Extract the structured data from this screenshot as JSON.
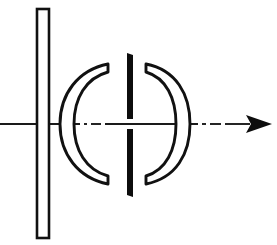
{
  "figure": {
    "kind": "optical-system-schematic",
    "background_color": "#ffffff",
    "ink_color": "#111111",
    "width": 277,
    "height": 245
  },
  "optical_axis": {
    "name": "optical-axis",
    "y": 124,
    "x_start": 0,
    "x_end": 272,
    "direction": "left-to-right",
    "line_style": "dash-dot",
    "arrowhead": "solid-triangle-right",
    "color": "#1a1a1a",
    "segments": [
      {
        "type": "solid",
        "x1": 0,
        "x2": 80
      },
      {
        "type": "dot",
        "x1": 84,
        "x2": 87
      },
      {
        "type": "dash",
        "x1": 91,
        "x2": 101
      },
      {
        "type": "solid",
        "x1": 105,
        "x2": 198
      },
      {
        "type": "dot",
        "x1": 202,
        "x2": 206
      },
      {
        "type": "dash",
        "x1": 210,
        "x2": 221
      },
      {
        "type": "solid",
        "x1": 225,
        "x2": 249
      }
    ],
    "arrow": {
      "tip_x": 272,
      "base_x": 246,
      "half_height": 9
    }
  },
  "elements": [
    {
      "id": "flat-plate",
      "label": "Plane parallel plate",
      "shape": "thin-vertical-rectangle",
      "fill": "#ffffff",
      "stroke": "#111111",
      "x": 37,
      "y": 9,
      "width": 12,
      "height": 229
    },
    {
      "id": "left-meniscus-lens",
      "label": "Left crescent meniscus element",
      "shape": "crescent-concave-right",
      "fill": "#ffffff",
      "stroke": "#111111",
      "center_y": 124,
      "outer_vertex_x": 60,
      "inner_vertex_x": 74,
      "top_tip_x": 108,
      "top_tip_y": 64,
      "bottom_tip_y": 184
    },
    {
      "id": "aperture-stop",
      "label": "Aperture stop",
      "shape": "two-solid-bars-with-axial-gap",
      "fill": "#0d0d0d",
      "x": 126,
      "width": 7,
      "top_bar": {
        "y_top": 53,
        "y_bottom": 119
      },
      "bottom_bar": {
        "y_top": 129,
        "y_bottom": 197
      },
      "gap_height": 10
    },
    {
      "id": "right-meniscus-lens",
      "label": "Right crescent meniscus element",
      "shape": "crescent-concave-left",
      "fill": "#ffffff",
      "stroke": "#111111",
      "center_y": 124,
      "inner_vertex_x": 167,
      "outer_vertex_x": 190,
      "top_tip_x": 146,
      "top_tip_y": 64,
      "bottom_tip_y": 184
    }
  ]
}
